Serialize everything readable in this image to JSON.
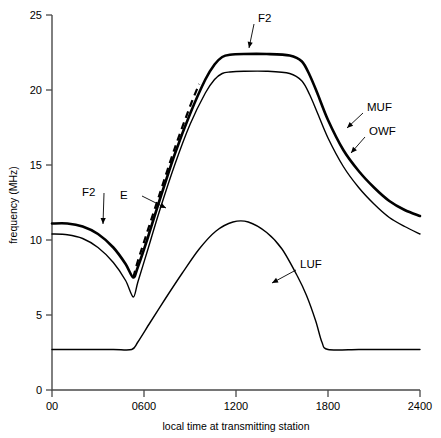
{
  "chart_data": {
    "type": "line",
    "title": "",
    "xlabel": "local time at transmitting station",
    "ylabel": "frequency (MHz)",
    "xlim": [
      0,
      2400
    ],
    "ylim": [
      0,
      25
    ],
    "grid": false,
    "legend_position": "inline-annotations",
    "x_ticks": [
      {
        "value": 0,
        "label": "00"
      },
      {
        "value": 600,
        "label": "0600"
      },
      {
        "value": 1200,
        "label": "1200"
      },
      {
        "value": 1800,
        "label": "1800"
      },
      {
        "value": 2400,
        "label": "2400"
      }
    ],
    "y_ticks": [
      {
        "value": 0,
        "label": "0"
      },
      {
        "value": 5,
        "label": "5"
      },
      {
        "value": 10,
        "label": "10"
      },
      {
        "value": 15,
        "label": "15"
      },
      {
        "value": 20,
        "label": "20"
      },
      {
        "value": 25,
        "label": "25"
      }
    ],
    "series": [
      {
        "name": "MUF",
        "style": "solid-thick",
        "x": [
          0,
          100,
          200,
          300,
          400,
          480,
          530,
          560,
          620,
          700,
          800,
          900,
          1000,
          1060,
          1110,
          1160,
          1250,
          1400,
          1550,
          1630,
          1680,
          1730,
          1800,
          1900,
          2000,
          2100,
          2200,
          2300,
          2400
        ],
        "y": [
          11.1,
          11.1,
          10.9,
          10.4,
          9.5,
          8.4,
          7.5,
          8.2,
          10.0,
          12.6,
          15.7,
          18.4,
          20.7,
          21.7,
          22.2,
          22.35,
          22.4,
          22.4,
          22.3,
          21.9,
          21.0,
          19.8,
          18.0,
          16.0,
          14.6,
          13.5,
          12.6,
          12.0,
          11.6
        ]
      },
      {
        "name": "OWF",
        "style": "solid-thin",
        "x": [
          0,
          100,
          200,
          300,
          400,
          480,
          530,
          560,
          620,
          700,
          800,
          900,
          1000,
          1060,
          1110,
          1160,
          1250,
          1400,
          1550,
          1630,
          1680,
          1730,
          1800,
          1900,
          2000,
          2100,
          2200,
          2300,
          2400
        ],
        "y": [
          10.4,
          10.35,
          10.1,
          9.5,
          8.5,
          7.3,
          6.2,
          7.2,
          9.2,
          11.9,
          15.0,
          17.7,
          19.8,
          20.7,
          21.1,
          21.2,
          21.25,
          21.25,
          21.1,
          20.6,
          19.7,
          18.5,
          16.8,
          14.9,
          13.5,
          12.4,
          11.5,
          10.9,
          10.4
        ]
      },
      {
        "name": "E",
        "style": "dashed",
        "x": [
          530,
          560,
          620,
          700,
          800,
          900,
          960
        ],
        "y": [
          7.5,
          8.6,
          10.5,
          13.0,
          16.1,
          18.9,
          20.4
        ]
      },
      {
        "name": "LUF",
        "style": "solid-thin",
        "x": [
          0,
          200,
          400,
          520,
          560,
          640,
          740,
          850,
          960,
          1070,
          1180,
          1280,
          1400,
          1500,
          1600,
          1660,
          1720,
          1760,
          1800,
          2000,
          2200,
          2400
        ],
        "y": [
          2.7,
          2.7,
          2.7,
          2.7,
          3.2,
          4.5,
          6.1,
          7.8,
          9.4,
          10.6,
          11.2,
          11.2,
          10.5,
          9.4,
          7.6,
          6.3,
          4.6,
          3.2,
          2.7,
          2.7,
          2.7,
          2.7
        ]
      }
    ],
    "annotations": [
      {
        "name": "f2-morning",
        "text": "F2",
        "label_x": 82,
        "label_y": 196,
        "arrow_to_x": 103,
        "arrow_to_y": 224
      },
      {
        "name": "e-layer",
        "text": "E",
        "label_x": 120,
        "label_y": 199,
        "arrow_to_x": 166,
        "arrow_to_y": 208
      },
      {
        "name": "f2-plateau",
        "text": "F2",
        "label_x": 258,
        "label_y": 22,
        "arrow_to_x": 249,
        "arrow_to_y": 48
      },
      {
        "name": "muf",
        "text": "MUF",
        "label_x": 367,
        "label_y": 111,
        "arrow_to_x": 347,
        "arrow_to_y": 128
      },
      {
        "name": "owf",
        "text": "OWF",
        "label_x": 369,
        "label_y": 135,
        "arrow_to_x": 351,
        "arrow_to_y": 153
      },
      {
        "name": "luf",
        "text": "LUF",
        "label_x": 300,
        "label_y": 268,
        "arrow_to_x": 272,
        "arrow_to_y": 283
      }
    ],
    "colors": {
      "curve": "#000000",
      "axis": "#4a4a4a",
      "background": "#ffffff"
    }
  }
}
